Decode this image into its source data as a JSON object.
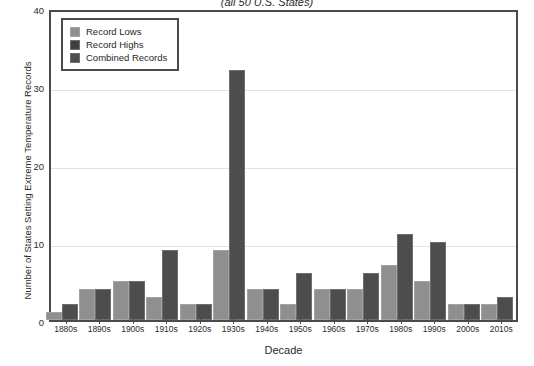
{
  "chart_data": {
    "type": "bar",
    "title": "(all 50 U.S. States)",
    "xlabel": "Decade",
    "ylabel": "Number of States Setting Extreme Temperature Records",
    "ylim": [
      0,
      40
    ],
    "yticks": [
      0,
      10,
      20,
      30,
      40
    ],
    "grid": true,
    "legend_position": "upper-left",
    "categories": [
      "1880s",
      "1890s",
      "1900s",
      "1910s",
      "1920s",
      "1930s",
      "1940s",
      "1950s",
      "1960s",
      "1970s",
      "1980s",
      "1990s",
      "2000s",
      "2010s"
    ],
    "series": [
      {
        "name": "Record Lows",
        "color": "#8f8f8f",
        "values": [
          1,
          4,
          5,
          3,
          2,
          9,
          4,
          2,
          4,
          4,
          7,
          5,
          2,
          2
        ]
      },
      {
        "name": "Combined Records",
        "color": "#4d4d4d",
        "values": [
          2,
          4,
          5,
          9,
          2,
          32,
          4,
          6,
          4,
          6,
          11,
          10,
          2,
          3
        ]
      }
    ],
    "legend": [
      {
        "label": "Record Lows",
        "swatch": "sw-light"
      },
      {
        "label": "Record Highs",
        "swatch": "sw-dark"
      },
      {
        "label": "Combined Records",
        "swatch": "sw-comb"
      }
    ]
  }
}
